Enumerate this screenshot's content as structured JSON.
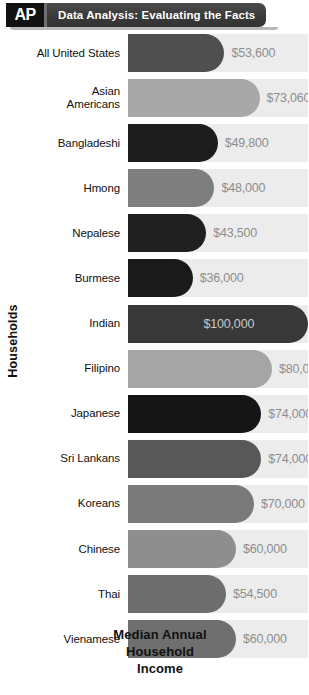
{
  "header": {
    "logo": "AP",
    "title": "Data Analysis: Evaluating the Facts"
  },
  "axis": {
    "y_label": "Households"
  },
  "footer": {
    "line1": "Median Annual",
    "line2": "Household",
    "line3": "Income"
  },
  "chart_data": {
    "type": "bar",
    "orientation": "horizontal",
    "title": "Data Analysis: Evaluating the Facts",
    "xlabel": "Median Annual Household Income",
    "ylabel": "Households",
    "xlim": [
      0,
      100000
    ],
    "grid": false,
    "legend": null,
    "categories": [
      "All United States",
      "Asian Americans",
      "Bangladeshi",
      "Hmong",
      "Nepalese",
      "Burmese",
      "Indian",
      "Filipino",
      "Japanese",
      "Sri Lankans",
      "Koreans",
      "Chinese",
      "Thai",
      "Vienamese"
    ],
    "values": [
      53600,
      73060,
      49800,
      48000,
      43500,
      36000,
      100000,
      80000,
      74000,
      74000,
      70000,
      60000,
      54500,
      60000
    ],
    "value_labels": [
      "$53,600",
      "$73,060",
      "$49,800",
      "$48,000",
      "$43,500",
      "$36,000",
      "$100,000",
      "$80,000",
      "$74,000",
      "$74,000",
      "$70,000",
      "$60,000",
      "$54,500",
      "$60,000"
    ],
    "bar_colors": [
      "#4f4f4f",
      "#a8a8a8",
      "#1d1d1d",
      "#7e7e7e",
      "#202020",
      "#1a1a1a",
      "#383838",
      "#a5a5a5",
      "#151515",
      "#585858",
      "#7a7a7a",
      "#8e8e8e",
      "#6e6e6e",
      "#6f6f6f"
    ],
    "label_lines": [
      [
        "All United States"
      ],
      [
        "Asian",
        "Americans"
      ],
      [
        "Bangladeshi"
      ],
      [
        "Hmong"
      ],
      [
        "Nepalese"
      ],
      [
        "Burmese"
      ],
      [
        "Indian"
      ],
      [
        "Filipino"
      ],
      [
        "Japanese"
      ],
      [
        "Sri Lankans"
      ],
      [
        "Koreans"
      ],
      [
        "Chinese"
      ],
      [
        "Thai"
      ],
      [
        "Vienamese"
      ]
    ],
    "track_color": "#ececec",
    "value_label_color": "#8e8e8e",
    "value_label_color_inside": "#c9c9c9"
  }
}
